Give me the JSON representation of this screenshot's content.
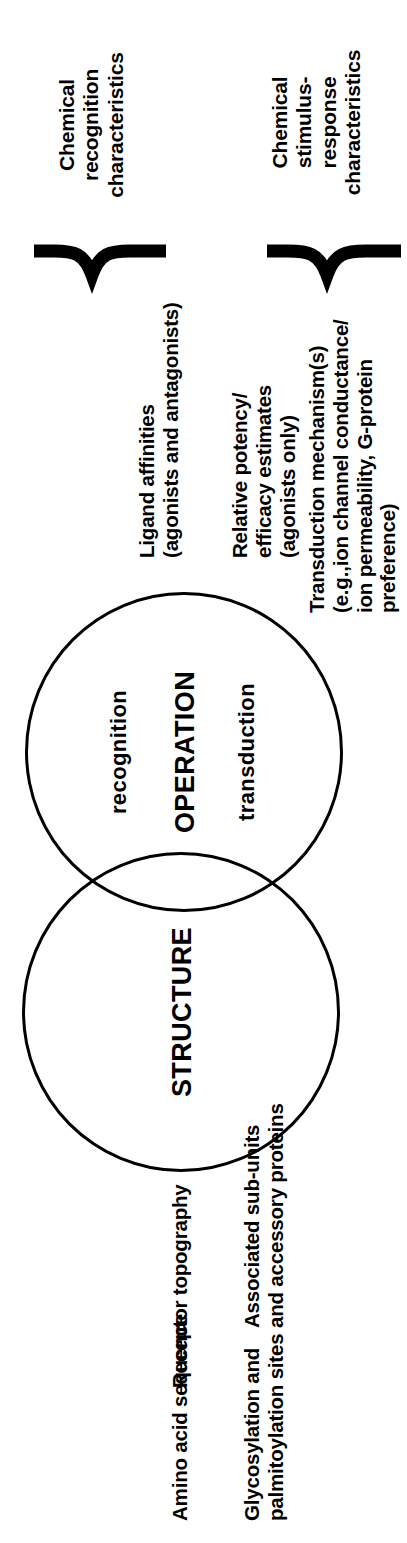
{
  "figure": {
    "title_structure": "STRUCTURE",
    "title_operation": "OPERATION",
    "operation_sub_left": "recognition",
    "operation_sub_right": "transduction"
  },
  "structure_items": [
    {
      "text": "Amino acid sequence"
    },
    {
      "text": "Glycosylation and\npalmitoylation sites"
    },
    {
      "text": "Receptor topography"
    },
    {
      "text": "Associated sub-units\nand accessory proteins"
    }
  ],
  "operation_items": [
    {
      "text": "Ligand affinities\n(agonists and antagonists)"
    },
    {
      "text": "Relative potency/\nefficacy estimates\n(agonists only)"
    },
    {
      "text": "Transduction mechanism(s)\n(e.g.,ion channel conductance/\nion permeability, G-protein\npreference)"
    }
  ],
  "bracket_titles": [
    {
      "text": "Chemical\nrecognition\ncharacteristics"
    },
    {
      "text": "Chemical\nstimulus-\nresponse\ncharacteristics"
    }
  ],
  "colors": {
    "ink": "#000000",
    "background": "#ffffff"
  }
}
